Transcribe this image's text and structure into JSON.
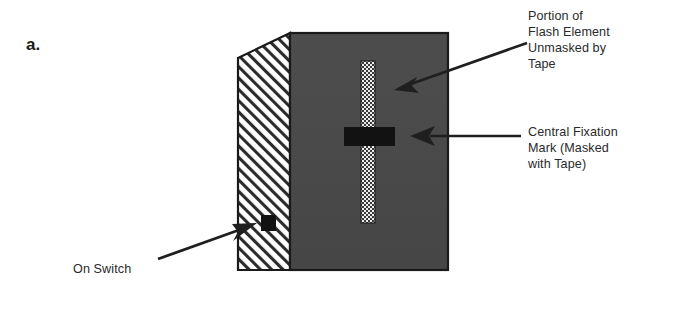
{
  "figure": {
    "panel_label": "a.",
    "colors": {
      "front_face": "#4a4a4a",
      "side_face_hatch_line": "#2b2b2b",
      "side_face_background": "#ffffff",
      "outline": "#1a1a1a",
      "mark_black": "#111111",
      "strip_light": "#e8e8e8",
      "strip_dot": "#3a3a3a",
      "text": "#2a2a2a",
      "background": "#ffffff"
    }
  },
  "callouts": {
    "flash_element": {
      "text": "Portion of\nFlash Element\nUnmasked by\nTape",
      "arrow": "arrow-pointing-down-left"
    },
    "fixation_mark": {
      "text": "Central Fixation\nMark (Masked\nwith Tape)",
      "arrow": "arrow-pointing-left"
    },
    "on_switch": {
      "text": "On Switch",
      "arrow": "arrow-pointing-up-right"
    }
  },
  "parts": {
    "front_face_name": "flash-front-face",
    "side_face_name": "device-side-face-hatched",
    "strip_name": "unmasked-flash-strip",
    "fixation_name": "central-fixation-mark",
    "switch_name": "on-switch-button"
  }
}
